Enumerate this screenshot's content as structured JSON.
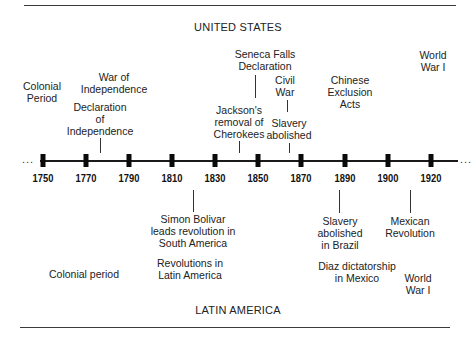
{
  "headings": {
    "top": "UNITED STATES",
    "bottom": "LATIN AMERICA"
  },
  "timeline": {
    "continuation_left": "...",
    "continuation_right": "...",
    "years": [
      "1750",
      "1770",
      "1790",
      "1810",
      "1830",
      "1850",
      "1870",
      "1890",
      "1900",
      "1920"
    ]
  },
  "united_states_events": [
    {
      "id": "colonial-period",
      "lines": [
        "Colonial",
        "Period"
      ]
    },
    {
      "id": "war-of-independence",
      "lines": [
        "War of",
        "Independence"
      ]
    },
    {
      "id": "declaration-of-independence",
      "lines": [
        "Declaration",
        "of",
        "Independence"
      ]
    },
    {
      "id": "seneca-falls",
      "lines": [
        "Seneca Falls",
        "Declaration"
      ]
    },
    {
      "id": "jacksons-removal",
      "lines": [
        "Jackson's",
        "removal of",
        "Cherokees"
      ]
    },
    {
      "id": "civil-war",
      "lines": [
        "Civil",
        "War"
      ]
    },
    {
      "id": "slavery-abolished-us",
      "lines": [
        "Slavery",
        "abolished"
      ]
    },
    {
      "id": "chinese-exclusion",
      "lines": [
        "Chinese",
        "Exclusion",
        "Acts"
      ]
    },
    {
      "id": "world-war-1-us",
      "lines": [
        "World",
        "War I"
      ]
    }
  ],
  "latin_america_events": [
    {
      "id": "simon-bolivar",
      "lines": [
        "Simon Bolivar",
        "leads revolution in",
        "South America"
      ]
    },
    {
      "id": "colonial-period-la",
      "lines": [
        "Colonial period"
      ]
    },
    {
      "id": "revolutions-latin-america",
      "lines": [
        "Revolutions in",
        "Latin America"
      ]
    },
    {
      "id": "slavery-abolished-brazil",
      "lines": [
        "Slavery",
        "abolished",
        "in Brazil"
      ]
    },
    {
      "id": "mexican-revolution",
      "lines": [
        "Mexican",
        "Revolution"
      ]
    },
    {
      "id": "diaz-dictatorship",
      "lines": [
        "Diaz dictatorship",
        "in Mexico"
      ]
    },
    {
      "id": "world-war-1-la",
      "lines": [
        "World",
        "War I"
      ]
    }
  ]
}
